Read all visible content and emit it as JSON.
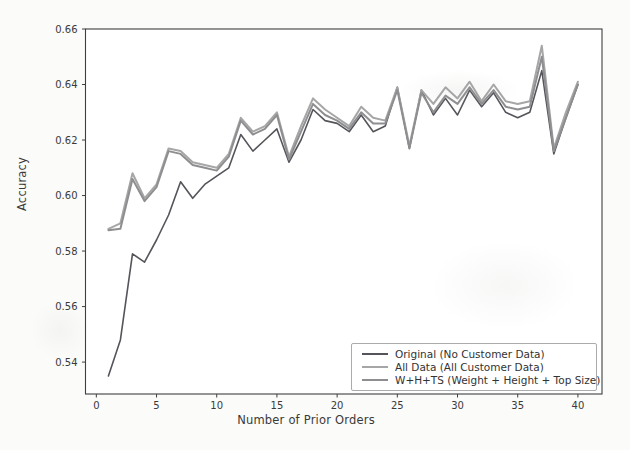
{
  "figure": {
    "background_color": "#fbfbf9",
    "plot_background_color": "#ffffff",
    "spine_color": "#3f3f3f",
    "text_color": "#3a3a3a"
  },
  "chart_data": {
    "type": "line",
    "title": "",
    "xlabel": "Number of Prior Orders",
    "ylabel": "Accuracy",
    "xlim": [
      -0.9,
      42
    ],
    "ylim": [
      0.5285,
      0.66
    ],
    "xticks": [
      0,
      5,
      10,
      15,
      20,
      25,
      30,
      35,
      40
    ],
    "yticks": [
      0.54,
      0.56,
      0.58,
      0.6,
      0.62,
      0.64,
      0.66
    ],
    "grid": false,
    "legend_position": "lower right",
    "x": [
      1,
      2,
      3,
      4,
      5,
      6,
      7,
      8,
      9,
      10,
      11,
      12,
      13,
      14,
      15,
      16,
      17,
      18,
      19,
      20,
      21,
      22,
      23,
      24,
      25,
      26,
      27,
      28,
      29,
      30,
      31,
      32,
      33,
      34,
      35,
      36,
      37,
      38,
      39,
      40
    ],
    "series": [
      {
        "name": "Original (No Customer Data)",
        "color": "#54545a",
        "line_width": 1.6,
        "values": [
          0.535,
          0.548,
          0.579,
          0.576,
          0.584,
          0.593,
          0.605,
          0.599,
          0.604,
          0.607,
          0.61,
          0.622,
          0.616,
          0.62,
          0.624,
          0.612,
          0.62,
          0.631,
          0.627,
          0.626,
          0.623,
          0.629,
          0.623,
          0.625,
          0.639,
          0.617,
          0.638,
          0.629,
          0.635,
          0.629,
          0.638,
          0.632,
          0.637,
          0.63,
          0.628,
          0.63,
          0.645,
          0.615,
          0.628,
          0.64
        ]
      },
      {
        "name": "All Data (All Customer Data)",
        "color": "#a6a6a7",
        "line_width": 2.0,
        "values": [
          0.588,
          0.59,
          0.608,
          0.599,
          0.604,
          0.617,
          0.616,
          0.612,
          0.611,
          0.61,
          0.615,
          0.628,
          0.623,
          0.625,
          0.63,
          0.614,
          0.625,
          0.635,
          0.631,
          0.628,
          0.625,
          0.632,
          0.628,
          0.627,
          0.639,
          0.618,
          0.638,
          0.633,
          0.639,
          0.635,
          0.641,
          0.634,
          0.64,
          0.634,
          0.633,
          0.634,
          0.654,
          0.617,
          0.63,
          0.641
        ]
      },
      {
        "name": "W+H+TS (Weight + Height + Top Size)",
        "color": "#8e8e91",
        "line_width": 2.0,
        "values": [
          0.5875,
          0.588,
          0.606,
          0.598,
          0.603,
          0.616,
          0.615,
          0.611,
          0.61,
          0.609,
          0.614,
          0.627,
          0.622,
          0.624,
          0.629,
          0.613,
          0.623,
          0.633,
          0.629,
          0.627,
          0.624,
          0.63,
          0.626,
          0.626,
          0.638,
          0.617,
          0.637,
          0.63,
          0.636,
          0.633,
          0.639,
          0.633,
          0.638,
          0.632,
          0.631,
          0.632,
          0.65,
          0.616,
          0.628,
          0.64
        ]
      }
    ]
  }
}
